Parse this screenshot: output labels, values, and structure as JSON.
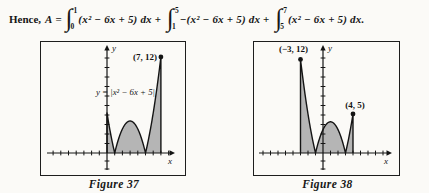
{
  "formula": {
    "hence": "Hence,",
    "variable": "A",
    "equals": "=",
    "integral_sign": "∫",
    "plus": "+",
    "terms": [
      {
        "lower": "0",
        "upper": "1",
        "integrand": "(x² − 6x + 5) dx"
      },
      {
        "lower": "1",
        "upper": "5",
        "integrand": "−(x² − 6x + 5) dx"
      },
      {
        "lower": "5",
        "upper": "7",
        "integrand": "(x² − 6x + 5) dx."
      }
    ]
  },
  "chart_data": [
    {
      "type": "area",
      "title": "Figure 37",
      "function_label": "y = |x² − 6x + 5|",
      "function": {
        "a": 1,
        "b": -6,
        "c": 5,
        "absolute_value": true
      },
      "x_range": [
        0,
        7
      ],
      "roots": [
        1,
        5
      ],
      "local_max": {
        "x": 3,
        "y": 4
      },
      "labeled_points": [
        {
          "x": 7,
          "y": 12,
          "label": "(7, 12)"
        }
      ],
      "xlabel": "x",
      "ylabel": "y",
      "grid": false,
      "shaded": true,
      "shade_color": "#b5b5b5",
      "line_color": "#141414"
    },
    {
      "type": "area",
      "title": "Figure 38",
      "function_label": "",
      "function": {
        "a": 1,
        "b": -2,
        "c": -3,
        "absolute_value": true
      },
      "x_range": [
        -3,
        4
      ],
      "roots": [
        -1,
        3
      ],
      "local_max": {
        "x": 1,
        "y": 4
      },
      "labeled_points": [
        {
          "x": -3,
          "y": 12,
          "label": "(−3, 12)"
        },
        {
          "x": 4,
          "y": 5,
          "label": "(4, 5)"
        }
      ],
      "xlabel": "x",
      "ylabel": "y",
      "grid": false,
      "shaded": true,
      "shade_color": "#b5b5b5",
      "line_color": "#141414"
    }
  ]
}
